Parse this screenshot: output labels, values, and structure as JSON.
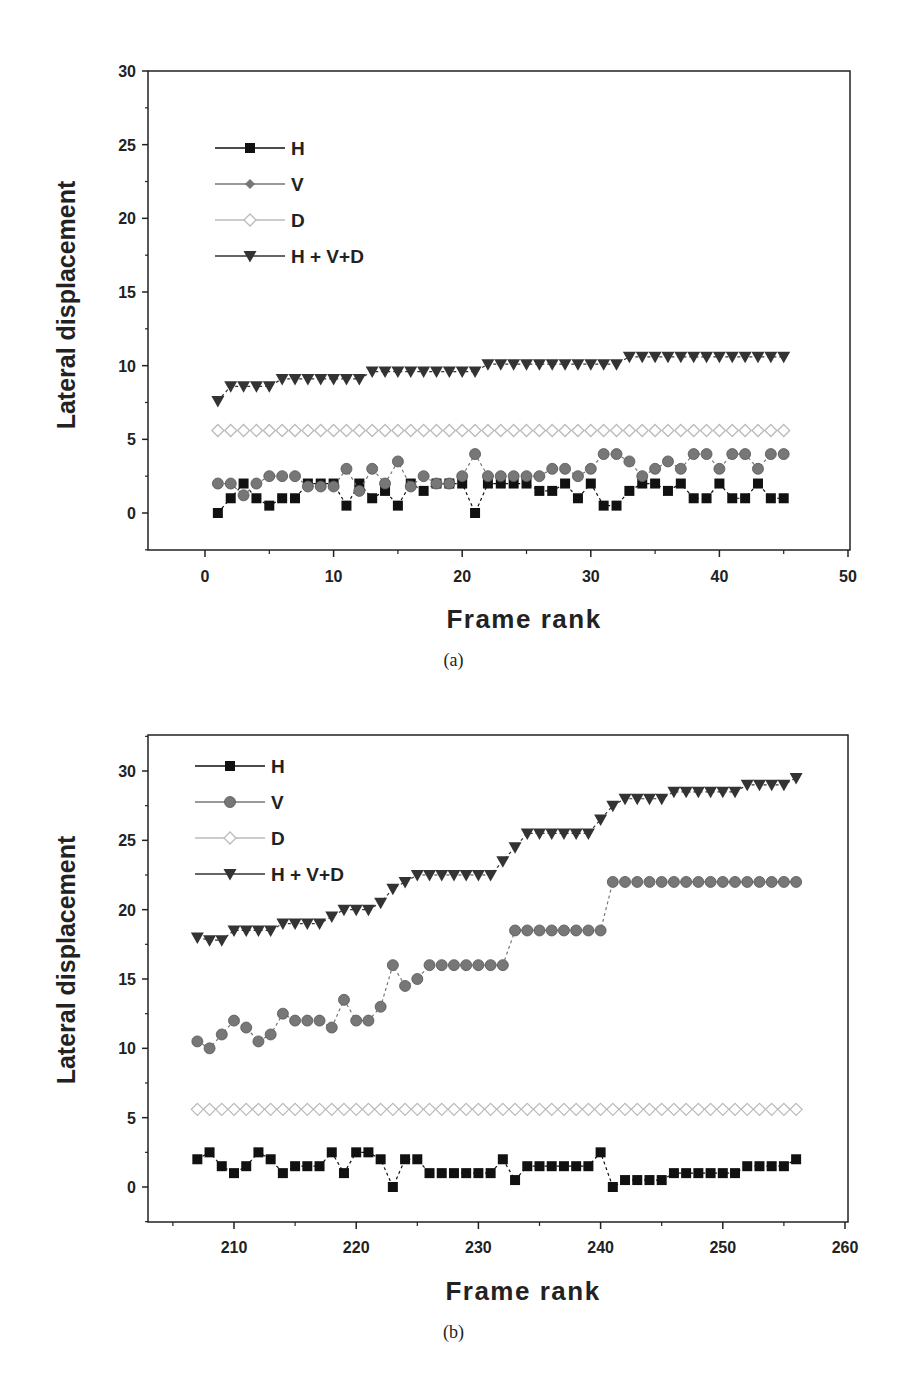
{
  "figure": {
    "captions": [
      "(a)",
      "(b)"
    ]
  },
  "chart_data": [
    {
      "type": "line",
      "panel": "(a)",
      "title": "",
      "xlabel": "Frame rank",
      "ylabel": "Lateral displacement",
      "xlim": [
        -4.4,
        50.2
      ],
      "ylim": [
        -2.5,
        30
      ],
      "xticks": [
        0,
        10,
        20,
        30,
        40,
        50
      ],
      "yticks": [
        0,
        5,
        10,
        15,
        20,
        25,
        30
      ],
      "grid": false,
      "legend_position": "upper left",
      "legend": [
        "H",
        "V",
        "D",
        "H + V+D"
      ],
      "x": [
        1,
        2,
        3,
        4,
        5,
        6,
        7,
        8,
        9,
        10,
        11,
        12,
        13,
        14,
        15,
        16,
        17,
        18,
        19,
        20,
        21,
        22,
        23,
        24,
        25,
        26,
        27,
        28,
        29,
        30,
        31,
        32,
        33,
        34,
        35,
        36,
        37,
        38,
        39,
        40,
        41,
        42,
        43,
        44,
        45
      ],
      "series": [
        {
          "name": "H",
          "marker": "square",
          "color": "#111111",
          "values": [
            0,
            1,
            2,
            1,
            0.5,
            1,
            1,
            2,
            2,
            2,
            0.5,
            2,
            1,
            1.5,
            0.5,
            2,
            1.5,
            2,
            2,
            2,
            0,
            2,
            2,
            2,
            2,
            1.5,
            1.5,
            2,
            1,
            2,
            0.5,
            0.5,
            1.5,
            2,
            2,
            1.5,
            2,
            1,
            1,
            2,
            1,
            1,
            2,
            1,
            1
          ]
        },
        {
          "name": "V",
          "marker": "circle",
          "color": "#777777",
          "values": [
            2,
            2,
            1.2,
            2,
            2.5,
            2.5,
            2.5,
            1.8,
            1.8,
            1.8,
            3,
            1.5,
            3,
            2,
            3.5,
            1.8,
            2.5,
            2,
            2,
            2.5,
            4,
            2.5,
            2.5,
            2.5,
            2.5,
            2.5,
            3,
            3,
            2.5,
            3,
            4,
            4,
            3.5,
            2.5,
            3,
            3.5,
            3,
            4,
            4,
            3,
            4,
            4,
            3,
            4,
            4
          ]
        },
        {
          "name": "D",
          "marker": "diamond-open",
          "color": "#bbbbbb",
          "values": [
            5.6,
            5.6,
            5.6,
            5.6,
            5.6,
            5.6,
            5.6,
            5.6,
            5.6,
            5.6,
            5.6,
            5.6,
            5.6,
            5.6,
            5.6,
            5.6,
            5.6,
            5.6,
            5.6,
            5.6,
            5.6,
            5.6,
            5.6,
            5.6,
            5.6,
            5.6,
            5.6,
            5.6,
            5.6,
            5.6,
            5.6,
            5.6,
            5.6,
            5.6,
            5.6,
            5.6,
            5.6,
            5.6,
            5.6,
            5.6,
            5.6,
            5.6,
            5.6,
            5.6,
            5.6
          ]
        },
        {
          "name": "H + V+D",
          "marker": "triangle-down",
          "color": "#333333",
          "values": [
            7.6,
            8.6,
            8.6,
            8.6,
            8.6,
            9.1,
            9.1,
            9.1,
            9.1,
            9.1,
            9.1,
            9.1,
            9.6,
            9.6,
            9.6,
            9.6,
            9.6,
            9.6,
            9.6,
            9.6,
            9.6,
            10.1,
            10.1,
            10.1,
            10.1,
            10.1,
            10.1,
            10.1,
            10.1,
            10.1,
            10.1,
            10.1,
            10.6,
            10.6,
            10.6,
            10.6,
            10.6,
            10.6,
            10.6,
            10.6,
            10.6,
            10.6,
            10.6,
            10.6,
            10.6
          ]
        }
      ]
    },
    {
      "type": "line",
      "panel": "(b)",
      "title": "",
      "xlabel": "Frame rank",
      "ylabel": "Lateral displacement",
      "xlim": [
        203,
        261.1
      ],
      "ylim": [
        -2.5,
        32.6
      ],
      "xticks": [
        210,
        220,
        230,
        240,
        250,
        260
      ],
      "yticks": [
        0,
        5,
        10,
        15,
        20,
        25,
        30
      ],
      "grid": false,
      "legend_position": "upper left",
      "legend": [
        "H",
        "V",
        "D",
        "H + V+D"
      ],
      "x": [
        207,
        208,
        209,
        210,
        211,
        212,
        213,
        214,
        215,
        216,
        217,
        218,
        219,
        220,
        221,
        222,
        223,
        224,
        225,
        226,
        227,
        228,
        229,
        230,
        231,
        232,
        233,
        234,
        235,
        236,
        237,
        238,
        239,
        240,
        241,
        242,
        243,
        244,
        245,
        246,
        247,
        248,
        249,
        250,
        251,
        252,
        253,
        254,
        255,
        256
      ],
      "series": [
        {
          "name": "H",
          "marker": "square",
          "color": "#111111",
          "values": [
            2,
            2.5,
            1.5,
            1,
            1.5,
            2.5,
            2,
            1,
            1.5,
            1.5,
            1.5,
            2.5,
            1,
            2.5,
            2.5,
            2,
            0,
            2,
            2,
            1,
            1,
            1,
            1,
            1,
            1,
            2,
            0.5,
            1.5,
            1.5,
            1.5,
            1.5,
            1.5,
            1.5,
            2.5,
            0,
            0.5,
            0.5,
            0.5,
            0.5,
            1,
            1,
            1,
            1,
            1,
            1,
            1.5,
            1.5,
            1.5,
            1.5,
            2
          ]
        },
        {
          "name": "V",
          "marker": "circle",
          "color": "#777777",
          "values": [
            10.5,
            10,
            11,
            12,
            11.5,
            10.5,
            11,
            12.5,
            12,
            12,
            12,
            11.5,
            13.5,
            12,
            12,
            13,
            16,
            14.5,
            15,
            16,
            16,
            16,
            16,
            16,
            16,
            16,
            18.5,
            18.5,
            18.5,
            18.5,
            18.5,
            18.5,
            18.5,
            18.5,
            22,
            22,
            22,
            22,
            22,
            22,
            22,
            22,
            22,
            22,
            22,
            22,
            22,
            22,
            22,
            22
          ]
        },
        {
          "name": "D",
          "marker": "diamond-open",
          "color": "#bbbbbb",
          "values": [
            5.6,
            5.6,
            5.6,
            5.6,
            5.6,
            5.6,
            5.6,
            5.6,
            5.6,
            5.6,
            5.6,
            5.6,
            5.6,
            5.6,
            5.6,
            5.6,
            5.6,
            5.6,
            5.6,
            5.6,
            5.6,
            5.6,
            5.6,
            5.6,
            5.6,
            5.6,
            5.6,
            5.6,
            5.6,
            5.6,
            5.6,
            5.6,
            5.6,
            5.6,
            5.6,
            5.6,
            5.6,
            5.6,
            5.6,
            5.6,
            5.6,
            5.6,
            5.6,
            5.6,
            5.6,
            5.6,
            5.6,
            5.6,
            5.6,
            5.6
          ]
        },
        {
          "name": "H + V+D",
          "marker": "triangle-down",
          "color": "#333333",
          "values": [
            18,
            17.8,
            17.8,
            18.5,
            18.5,
            18.5,
            18.5,
            19,
            19,
            19,
            19,
            19.5,
            20,
            20,
            20,
            20.5,
            21.5,
            22,
            22.5,
            22.5,
            22.5,
            22.5,
            22.5,
            22.5,
            22.5,
            23.5,
            24.5,
            25.5,
            25.5,
            25.5,
            25.5,
            25.5,
            25.5,
            26.5,
            27.5,
            28,
            28,
            28,
            28,
            28.5,
            28.5,
            28.5,
            28.5,
            28.5,
            28.5,
            29,
            29,
            29,
            29,
            29.5
          ]
        }
      ]
    }
  ],
  "layout": {
    "panels": [
      {
        "box": [
          148,
          71,
          850,
          550
        ],
        "x0px": 205,
        "x1px": 848,
        "x0": 0,
        "x1": 50,
        "y0px": 513,
        "y1px": 71,
        "y0": 0,
        "y1": 30,
        "xtickLabelY": 582,
        "xlabelY": 628,
        "ylabelX": 75,
        "ylabelY": 305,
        "captionY": 647,
        "legend": {
          "x": 215,
          "y": 148,
          "dy": 36
        }
      },
      {
        "box": [
          148,
          735,
          848,
          1222
        ],
        "x0px": 234,
        "x1px": 845,
        "x0": 210,
        "x1": 260,
        "y0px": 1187,
        "y1px": 771,
        "y0": 0,
        "y1": 30,
        "xtickLabelY": 1253,
        "xlabelY": 1300,
        "ylabelX": 75,
        "ylabelY": 960,
        "captionY": 1320,
        "legend": {
          "x": 195,
          "y": 766,
          "dy": 36
        }
      }
    ]
  }
}
